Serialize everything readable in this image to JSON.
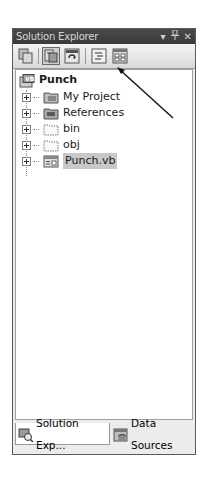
{
  "window": {
    "title": "Solution Explorer",
    "controls": {
      "dropdown": "▾",
      "pin": "⊥",
      "close": "✕"
    }
  },
  "toolbar": {
    "buttons": [
      {
        "name": "show-all-files",
        "icon": "show-all-files-icon",
        "pressed": false
      },
      {
        "name": "properties",
        "icon": "properties-icon",
        "pressed": true
      },
      {
        "name": "refresh",
        "icon": "refresh-icon",
        "pressed": false
      },
      {
        "name": "view-code",
        "icon": "view-code-icon",
        "pressed": false
      },
      {
        "name": "view-designer",
        "icon": "view-designer-icon",
        "pressed": false
      }
    ]
  },
  "tree": {
    "root": {
      "label": "Punch",
      "icon": "project-icon"
    },
    "children": [
      {
        "label": "My Project",
        "icon": "my-project-icon",
        "expandable": true,
        "selected": false
      },
      {
        "label": "References",
        "icon": "references-folder-icon",
        "expandable": true,
        "selected": false
      },
      {
        "label": "bin",
        "icon": "folder-icon",
        "expandable": true,
        "selected": false
      },
      {
        "label": "obj",
        "icon": "folder-icon",
        "expandable": true,
        "selected": false
      },
      {
        "label": "Punch.vb",
        "icon": "vb-file-icon",
        "expandable": true,
        "selected": true
      }
    ]
  },
  "tabs": [
    {
      "label": "Solution Exp...",
      "icon": "solution-explorer-icon",
      "active": true
    },
    {
      "label": "Data Sources",
      "icon": "data-sources-icon",
      "active": false
    }
  ],
  "annotation": {
    "type": "arrow",
    "target": "view-code-button"
  },
  "colors": {
    "titlebar": "#3f3f3f",
    "titlebar_text": "#d8d8d8",
    "selection": "#c8c8c8",
    "tree_bg": "#ffffff",
    "panel_bg": "#ececec"
  }
}
